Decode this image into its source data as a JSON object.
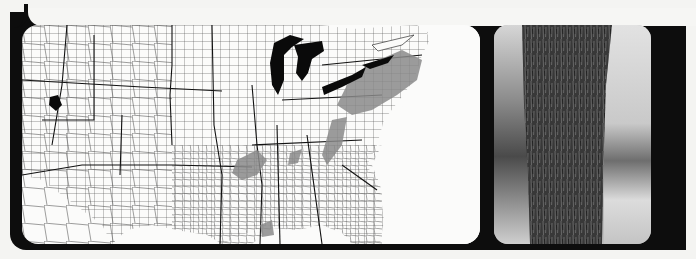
{
  "figure": {
    "map": {
      "description": "County outline map of the central and eastern United States with shaded species range",
      "colors": {
        "background": "#fbfbfa",
        "county_lines": "#3a3a3a",
        "state_lines": "#111111",
        "great_lakes": "#0a0a0a",
        "range_shading": "#8a8a8a",
        "range_shading_light": "#a8a8a8"
      },
      "shaded_regions": [
        "Northeast / New York / Pennsylvania",
        "Appalachian ridge",
        "Ozarks / Arkansas",
        "Louisiana / east Texas",
        "Great Salt Lake (black)"
      ]
    },
    "photo": {
      "description": "Black and white photograph of a tree trunk showing bark texture",
      "colors": {
        "bark_dark": "#2a2a2a",
        "bark_mid": "#6b6b6b",
        "background_light": "#d9d9d9",
        "background_dark": "#5a5a5a"
      }
    },
    "frame_color": "#0d0d0d",
    "page_color": "#f4f4f2"
  }
}
